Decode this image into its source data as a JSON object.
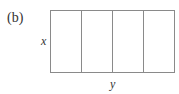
{
  "figure": {
    "panel_label": "(b)",
    "side_label": "x",
    "bottom_label": "y",
    "columns": 4
  }
}
